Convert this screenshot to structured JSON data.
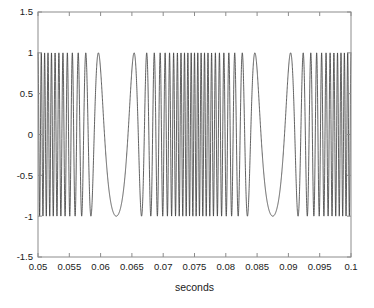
{
  "figure": {
    "background_color": "#ffffff",
    "axes_border_color": "#8c8c8c",
    "line_color": "#3a3a3a",
    "text_color": "#1a1a1a"
  },
  "chart_data": {
    "type": "line",
    "title": "",
    "xlabel": "seconds",
    "ylabel": "",
    "xlim": [
      0.05,
      0.1
    ],
    "ylim": [
      -1.5,
      1.5
    ],
    "grid": false,
    "legend": null,
    "x_ticks": [
      0.05,
      0.055,
      0.06,
      0.065,
      0.07,
      0.075,
      0.08,
      0.085,
      0.09,
      0.095,
      0.1
    ],
    "x_tick_labels": [
      "0.05",
      "0.055",
      "0.06",
      "0.065",
      "0.07",
      "0.075",
      "0.08",
      "0.085",
      "0.09",
      "0.095",
      "0.1"
    ],
    "y_ticks": [
      -1.5,
      -1,
      -0.5,
      0,
      0.5,
      1,
      1.5
    ],
    "y_tick_labels": [
      "-1.5",
      "-1",
      "-0.5",
      "0",
      "0.5",
      "1",
      "1.5"
    ],
    "series": [
      {
        "name": "fm-signal",
        "description": "Frequency modulated sinusoid, unit amplitude, carrier frequency swept by a low-frequency modulating tone",
        "amplitude": 1.0,
        "carrier_hz": 1000,
        "modulation_hz": 40,
        "frequency_deviation_hz": 900,
        "sample_count": 4000,
        "color": "#3a3a3a",
        "line_width": 0.8
      }
    ]
  },
  "axis": {
    "x_label_text": "seconds",
    "tick_direction": "in",
    "box": true
  }
}
